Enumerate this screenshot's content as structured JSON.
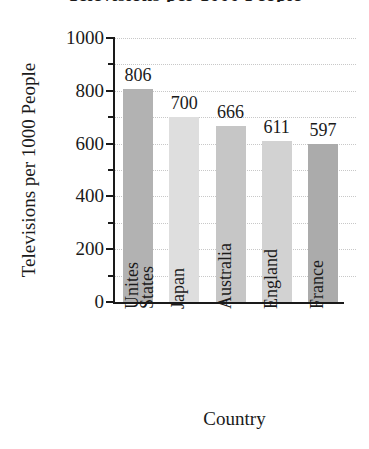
{
  "chart_data": {
    "type": "bar",
    "title": "Televisions per 1000 People",
    "xlabel": "Country",
    "ylabel": "Televisions per 1000 People",
    "categories": [
      "Unites States",
      "Japan",
      "Australia",
      "England",
      "France"
    ],
    "category_lines": [
      [
        "Unites",
        "States"
      ],
      [
        "Japan"
      ],
      [
        "Australia"
      ],
      [
        "England"
      ],
      [
        "France"
      ]
    ],
    "values": [
      806,
      700,
      666,
      611,
      597
    ],
    "value_labels": [
      "806",
      "700",
      "666",
      "611",
      "597"
    ],
    "ylim": [
      0,
      1000
    ],
    "ytick_labels": [
      "0",
      "200",
      "400",
      "600",
      "800",
      "1000"
    ],
    "ytick_values": [
      0,
      200,
      400,
      600,
      800,
      1000
    ],
    "minor_tick_values": [
      100,
      300,
      500,
      700,
      900
    ],
    "gridline_values": [
      100,
      200,
      300,
      400,
      500,
      600,
      700,
      800,
      900,
      1000
    ],
    "grid": true,
    "legend": false,
    "bar_colors": [
      "#b2b2b2",
      "#dedede",
      "#c6c6c6",
      "#d2d2d2",
      "#ababab"
    ],
    "axis_color": "#1a1a1a",
    "grid_color": "#c8c8c8",
    "background": "#ffffff"
  }
}
